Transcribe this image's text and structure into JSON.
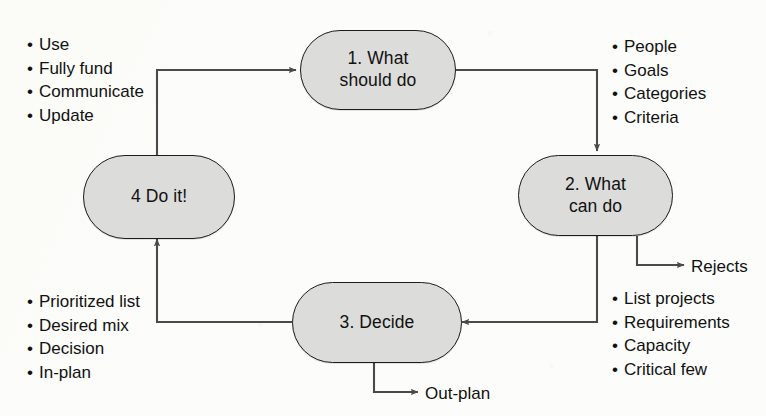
{
  "diagram": {
    "background_color": "#fcfcfa",
    "node_fill_color": "#dcdcda",
    "node_border_color": "#1c1c1c",
    "line_color": "#4a4a4a",
    "text_color": "#111111"
  },
  "nodes": [
    {
      "id": "step1",
      "label": "1. What\nshould do"
    },
    {
      "id": "step2",
      "label": "2. What\ncan do"
    },
    {
      "id": "step3",
      "label": "3. Decide"
    },
    {
      "id": "step4",
      "label": "4 Do it!"
    }
  ],
  "bullet_groups": [
    {
      "id": "top-left",
      "related_to": "step4",
      "items": [
        "Use",
        "Fully fund",
        "Communicate",
        "Update"
      ]
    },
    {
      "id": "top-right",
      "related_to": "step1",
      "items": [
        "People",
        "Goals",
        "Categories",
        "Criteria"
      ]
    },
    {
      "id": "bottom-right",
      "related_to": "step2",
      "items": [
        "List projects",
        "Requirements",
        "Capacity",
        "Critical few"
      ]
    },
    {
      "id": "bottom-left",
      "related_to": "step3",
      "items": [
        "Prioritized list",
        "Desired mix",
        "Decision",
        "In-plan"
      ]
    }
  ],
  "edge_labels": [
    {
      "id": "rejects",
      "text": "Rejects",
      "from": "step2"
    },
    {
      "id": "out-plan",
      "text": "Out-plan",
      "from": "step3"
    }
  ],
  "bullet_glyph": "•"
}
